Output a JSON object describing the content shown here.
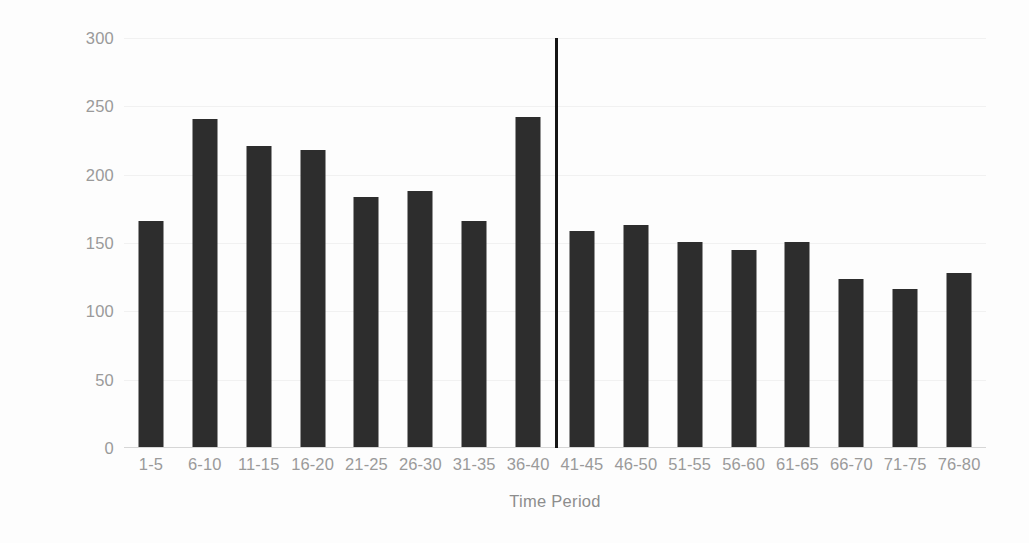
{
  "chart_data": {
    "type": "bar",
    "title": "",
    "xlabel": "Time Period",
    "ylabel": "Penalties Scored",
    "categories": [
      "1-5",
      "6-10",
      "11-15",
      "16-20",
      "21-25",
      "26-30",
      "31-35",
      "36-40",
      "41-45",
      "46-50",
      "51-55",
      "56-60",
      "61-65",
      "66-70",
      "71-75",
      "76-80"
    ],
    "values": [
      166,
      241,
      221,
      218,
      184,
      188,
      166,
      242,
      159,
      163,
      151,
      145,
      151,
      124,
      116,
      128
    ],
    "ylim": [
      0,
      300
    ],
    "yticks": [
      0,
      50,
      100,
      150,
      200,
      250,
      300
    ],
    "ytick_labels": [
      "0",
      "50",
      "100",
      "150",
      "200",
      "250",
      "300"
    ],
    "grid": true,
    "legend": "none",
    "annotations": [
      {
        "name": "half-time-divider",
        "type": "vertical-line",
        "after_category": "36-40",
        "value_top": 300,
        "color": "#151515"
      }
    ],
    "series_color": "#2d2d2d",
    "background_color": "#fdfdfd",
    "axis_label_color": "#9a9a9a"
  }
}
